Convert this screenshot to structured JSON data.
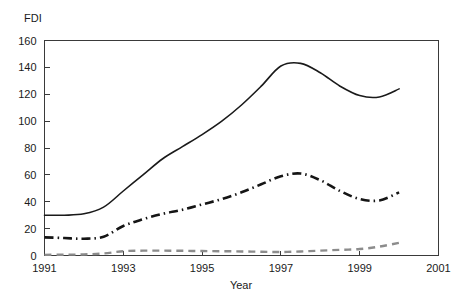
{
  "chart_data": {
    "type": "line",
    "title": "",
    "corner_label": "FDI",
    "xlabel": "Year",
    "ylabel": "FDI",
    "grid": false,
    "legend": "none",
    "xlim": [
      1991,
      2001
    ],
    "ylim": [
      0,
      160
    ],
    "x_ticks": [
      "1991",
      "1993",
      "1995",
      "1997",
      "1999",
      "2001"
    ],
    "x_tick_values": [
      1991,
      1993,
      1995,
      1997,
      1999,
      2001
    ],
    "y_ticks": [
      "0",
      "20",
      "40",
      "60",
      "80",
      "100",
      "120",
      "140",
      "160"
    ],
    "y_tick_values": [
      0,
      20,
      40,
      60,
      80,
      100,
      120,
      140,
      160
    ],
    "x": [
      1991,
      1991.5,
      1992,
      1992.5,
      1993,
      1993.5,
      1994,
      1994.5,
      1995,
      1995.5,
      1996,
      1996.5,
      1997,
      1997.5,
      1998,
      1998.5,
      1999,
      1999.5,
      2000
    ],
    "series": [
      {
        "name": "total",
        "style": "solid",
        "color": "#1a1a1a",
        "width": 1.6,
        "values": [
          30,
          30,
          31,
          36,
          48,
          60,
          72,
          81,
          90,
          100,
          112,
          126,
          141,
          143,
          136,
          126,
          119,
          118,
          124
        ]
      },
      {
        "name": "middle",
        "style": "dash-dot",
        "color": "#151515",
        "width": 2.6,
        "values": [
          13.5,
          13,
          12.5,
          14,
          22,
          27,
          31,
          34,
          38,
          42,
          47,
          53,
          59,
          61,
          56,
          48,
          42,
          41,
          47
        ]
      },
      {
        "name": "lower",
        "style": "dashed",
        "color": "#8c8c8c",
        "width": 2.4,
        "values": [
          0.5,
          0.6,
          0.8,
          1.5,
          3.2,
          3.6,
          3.6,
          3.5,
          3.3,
          3.2,
          3.0,
          2.8,
          2.6,
          3.0,
          3.6,
          4.2,
          4.8,
          6.6,
          9.4
        ]
      }
    ]
  },
  "axes": {
    "x_axis_name": "year-axis",
    "y_axis_name": "fdi-axis"
  }
}
